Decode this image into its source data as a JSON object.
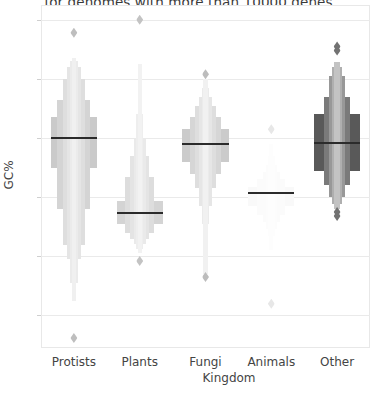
{
  "chart_data": {
    "type": "box",
    "variant": "letter-value-boxen",
    "title": "for genomes with more than 10000 genes",
    "xlabel": "Kingdom",
    "ylabel": "GC%",
    "categories": [
      "Protists",
      "Plants",
      "Fungi",
      "Animals",
      "Other"
    ],
    "yticks": [
      70,
      60,
      50,
      40,
      30,
      20
    ],
    "ylim": [
      14.5,
      72.5
    ],
    "grid": "horizontal",
    "legend": "none",
    "series": [
      {
        "name": "Protists",
        "color": "#b3b3b3",
        "median": 50.0,
        "boxes": [
          {
            "low": 45.0,
            "high": 53.5,
            "width": 1.0,
            "shade": 0.7
          },
          {
            "low": 38.0,
            "high": 56.5,
            "width": 0.72,
            "shade": 0.56
          },
          {
            "low": 32.0,
            "high": 60.0,
            "width": 0.48,
            "shade": 0.44
          },
          {
            "low": 29.5,
            "high": 62.0,
            "width": 0.3,
            "shade": 0.34
          },
          {
            "low": 25.5,
            "high": 63.0,
            "width": 0.18,
            "shade": 0.26
          },
          {
            "low": 22.5,
            "high": 63.5,
            "width": 0.1,
            "shade": 0.2
          }
        ],
        "fliers": [
          67.8,
          16.2
        ]
      },
      {
        "name": "Plants",
        "color": "#b8b8b8",
        "median": 37.4,
        "boxes": [
          {
            "low": 35.5,
            "high": 39.4,
            "width": 1.0,
            "shade": 0.6
          },
          {
            "low": 34.0,
            "high": 43.5,
            "width": 0.62,
            "shade": 0.48
          },
          {
            "low": 33.0,
            "high": 47.0,
            "width": 0.4,
            "shade": 0.38
          },
          {
            "low": 32.0,
            "high": 50.0,
            "width": 0.26,
            "shade": 0.3
          },
          {
            "low": 31.2,
            "high": 54.0,
            "width": 0.16,
            "shade": 0.24
          },
          {
            "low": 30.5,
            "high": 62.5,
            "width": 0.09,
            "shade": 0.18
          }
        ],
        "fliers": [
          70.0,
          29.2
        ]
      },
      {
        "name": "Fungi",
        "color": "#b0b0b0",
        "median": 49.0,
        "boxes": [
          {
            "low": 46.0,
            "high": 51.5,
            "width": 1.0,
            "shade": 0.66
          },
          {
            "low": 44.0,
            "high": 53.5,
            "width": 0.66,
            "shade": 0.52
          },
          {
            "low": 41.5,
            "high": 55.5,
            "width": 0.44,
            "shade": 0.42
          },
          {
            "low": 38.5,
            "high": 57.0,
            "width": 0.28,
            "shade": 0.32
          },
          {
            "low": 35.5,
            "high": 58.5,
            "width": 0.17,
            "shade": 0.25
          },
          {
            "low": 27.0,
            "high": 60.0,
            "width": 0.09,
            "shade": 0.18
          }
        ],
        "fliers": [
          60.8,
          26.5
        ]
      },
      {
        "name": "Animals",
        "color": "#e3e3e3",
        "median": 40.7,
        "boxes": [
          {
            "low": 38.5,
            "high": 41.8,
            "width": 1.0,
            "shade": 0.2
          },
          {
            "low": 37.0,
            "high": 43.0,
            "width": 0.6,
            "shade": 0.16
          },
          {
            "low": 35.8,
            "high": 44.2,
            "width": 0.38,
            "shade": 0.13
          },
          {
            "low": 34.6,
            "high": 45.5,
            "width": 0.24,
            "shade": 0.1
          },
          {
            "low": 33.5,
            "high": 47.0,
            "width": 0.14,
            "shade": 0.08
          },
          {
            "low": 31.0,
            "high": 49.0,
            "width": 0.08,
            "shade": 0.06
          }
        ],
        "fliers": [
          51.5,
          22.0
        ]
      },
      {
        "name": "Other",
        "color": "#595959",
        "median": 49.2,
        "boxes": [
          {
            "low": 44.5,
            "high": 54.0,
            "width": 1.0,
            "shade": 1.0
          },
          {
            "low": 42.0,
            "high": 57.0,
            "width": 0.56,
            "shade": 0.8
          },
          {
            "low": 40.0,
            "high": 60.5,
            "width": 0.34,
            "shade": 0.62
          },
          {
            "low": 38.8,
            "high": 62.0,
            "width": 0.2,
            "shade": 0.48
          },
          {
            "low": 38.0,
            "high": 62.8,
            "width": 0.12,
            "shade": 0.36
          }
        ],
        "fliers": [
          65.5,
          64.8,
          37.5,
          36.8
        ]
      }
    ]
  }
}
